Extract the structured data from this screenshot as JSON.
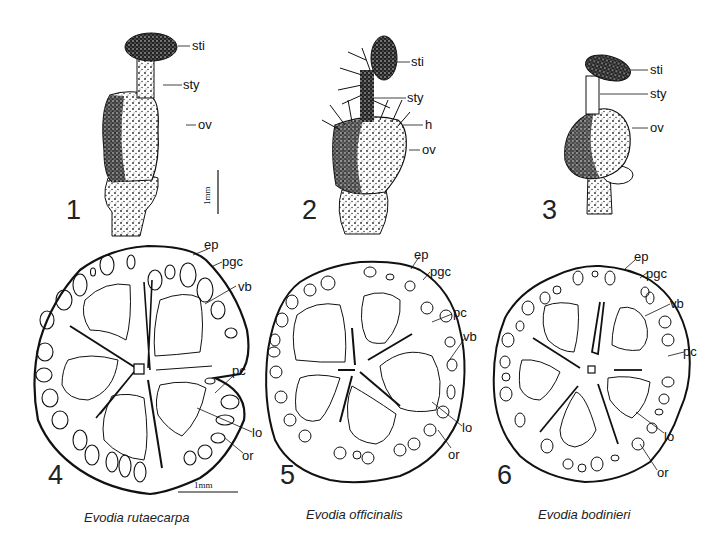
{
  "figure": {
    "panels": [
      {
        "number": "1",
        "type": "pistil",
        "labels": [
          "sti",
          "sty",
          "ov"
        ],
        "scale": "1mm"
      },
      {
        "number": "2",
        "type": "pistil",
        "labels": [
          "sti",
          "sty",
          "h",
          "ov"
        ]
      },
      {
        "number": "3",
        "type": "pistil",
        "labels": [
          "sti",
          "sty",
          "ov"
        ]
      },
      {
        "number": "4",
        "type": "cross-section",
        "labels": [
          "ep",
          "pgc",
          "vb",
          "pc",
          "lo",
          "or"
        ],
        "scale": "1mm",
        "caption": "Evodia rutaecarpa"
      },
      {
        "number": "5",
        "type": "cross-section",
        "labels": [
          "ep",
          "pgc",
          "pc",
          "vb",
          "lo",
          "or"
        ],
        "caption": "Evodia officinalis"
      },
      {
        "number": "6",
        "type": "cross-section",
        "labels": [
          "ep",
          "pgc",
          "vb",
          "pc",
          "lo",
          "or"
        ],
        "caption": "Evodia bodinieri"
      }
    ]
  }
}
